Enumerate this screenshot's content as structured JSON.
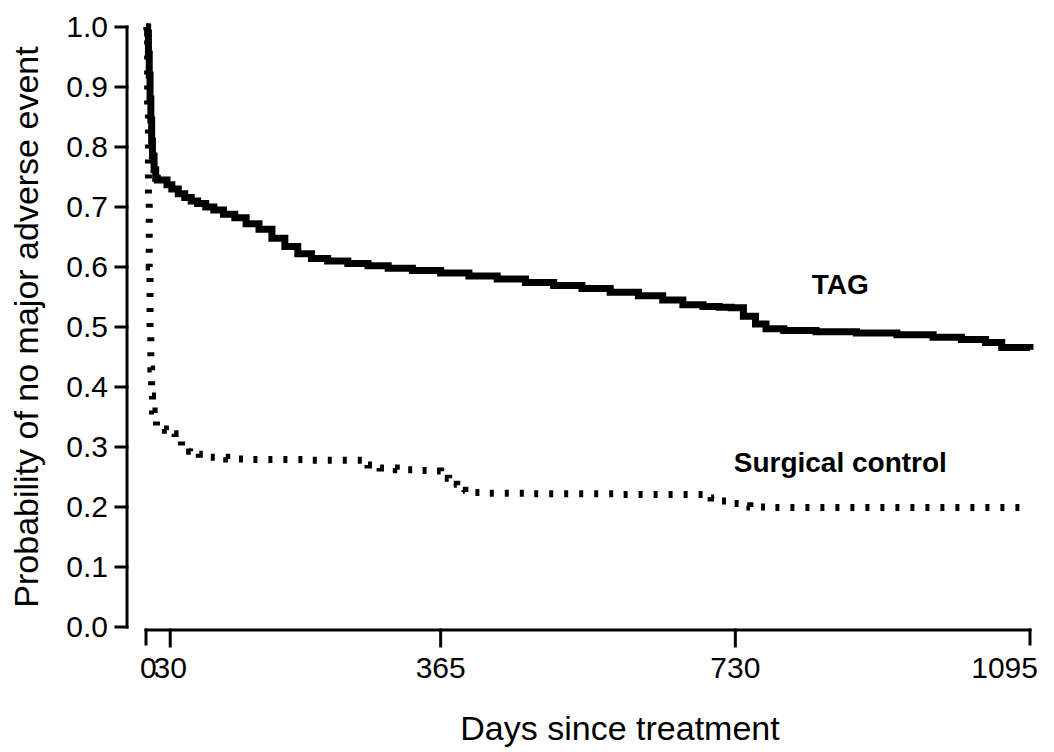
{
  "chart_data": {
    "type": "line",
    "title": "",
    "subtitle": "",
    "xlabel": "Days since treatment",
    "ylabel": "Probability of no major adverse event",
    "xlim": [
      0,
      1095
    ],
    "ylim": [
      0.0,
      1.0
    ],
    "grid": false,
    "legend_position": "inline-annotation",
    "x_ticks": [
      0,
      30,
      365,
      730,
      1095
    ],
    "x_tick_labels": [
      "0",
      "30",
      "365",
      "730",
      "1095"
    ],
    "y_ticks": [
      0.0,
      0.1,
      0.2,
      0.3,
      0.4,
      0.5,
      0.6,
      0.7,
      0.8,
      0.9,
      1.0
    ],
    "y_tick_labels": [
      "0.0",
      "0.1",
      "0.2",
      "0.3",
      "0.4",
      "0.5",
      "0.6",
      "0.7",
      "0.8",
      "0.9",
      "1.0"
    ],
    "annotations": [
      {
        "text": "TAG",
        "x": 860,
        "y": 0.555,
        "style": "bold"
      },
      {
        "text": "Surgical control",
        "x": 860,
        "y": 0.258,
        "style": "bold"
      }
    ],
    "series": [
      {
        "name": "TAG",
        "style": "solid",
        "points": [
          [
            0,
            1.0
          ],
          [
            2,
            0.99
          ],
          [
            3,
            0.955
          ],
          [
            4,
            0.92
          ],
          [
            5,
            0.88
          ],
          [
            6,
            0.845
          ],
          [
            7,
            0.81
          ],
          [
            8,
            0.785
          ],
          [
            10,
            0.762
          ],
          [
            12,
            0.748
          ],
          [
            14,
            0.745
          ],
          [
            22,
            0.745
          ],
          [
            26,
            0.737
          ],
          [
            32,
            0.73
          ],
          [
            40,
            0.722
          ],
          [
            48,
            0.716
          ],
          [
            56,
            0.71
          ],
          [
            64,
            0.706
          ],
          [
            74,
            0.7
          ],
          [
            84,
            0.695
          ],
          [
            96,
            0.688
          ],
          [
            110,
            0.682
          ],
          [
            124,
            0.672
          ],
          [
            140,
            0.663
          ],
          [
            156,
            0.648
          ],
          [
            172,
            0.634
          ],
          [
            188,
            0.622
          ],
          [
            205,
            0.614
          ],
          [
            225,
            0.61
          ],
          [
            250,
            0.606
          ],
          [
            275,
            0.602
          ],
          [
            300,
            0.598
          ],
          [
            330,
            0.594
          ],
          [
            365,
            0.59
          ],
          [
            400,
            0.585
          ],
          [
            435,
            0.58
          ],
          [
            470,
            0.574
          ],
          [
            505,
            0.569
          ],
          [
            540,
            0.564
          ],
          [
            575,
            0.558
          ],
          [
            610,
            0.552
          ],
          [
            640,
            0.545
          ],
          [
            665,
            0.537
          ],
          [
            690,
            0.534
          ],
          [
            710,
            0.533
          ],
          [
            725,
            0.532
          ],
          [
            740,
            0.518
          ],
          [
            755,
            0.505
          ],
          [
            768,
            0.497
          ],
          [
            790,
            0.494
          ],
          [
            830,
            0.492
          ],
          [
            880,
            0.49
          ],
          [
            930,
            0.487
          ],
          [
            975,
            0.483
          ],
          [
            1010,
            0.479
          ],
          [
            1040,
            0.474
          ],
          [
            1060,
            0.466
          ],
          [
            1095,
            0.462
          ]
        ]
      },
      {
        "name": "Surgical control",
        "style": "dotted",
        "points": [
          [
            0,
            1.0
          ],
          [
            1,
            0.98
          ],
          [
            2,
            0.86
          ],
          [
            3,
            0.72
          ],
          [
            4,
            0.6
          ],
          [
            5,
            0.5
          ],
          [
            6,
            0.43
          ],
          [
            7,
            0.385
          ],
          [
            8,
            0.36
          ],
          [
            10,
            0.345
          ],
          [
            13,
            0.335
          ],
          [
            17,
            0.33
          ],
          [
            24,
            0.328
          ],
          [
            30,
            0.322
          ],
          [
            36,
            0.31
          ],
          [
            44,
            0.3
          ],
          [
            54,
            0.293
          ],
          [
            66,
            0.288
          ],
          [
            80,
            0.283
          ],
          [
            100,
            0.28
          ],
          [
            130,
            0.279
          ],
          [
            165,
            0.279
          ],
          [
            200,
            0.278
          ],
          [
            235,
            0.278
          ],
          [
            268,
            0.277
          ],
          [
            275,
            0.27
          ],
          [
            290,
            0.265
          ],
          [
            310,
            0.262
          ],
          [
            335,
            0.261
          ],
          [
            355,
            0.26
          ],
          [
            365,
            0.248
          ],
          [
            375,
            0.238
          ],
          [
            385,
            0.228
          ],
          [
            395,
            0.224
          ],
          [
            420,
            0.223
          ],
          [
            470,
            0.222
          ],
          [
            530,
            0.222
          ],
          [
            590,
            0.221
          ],
          [
            650,
            0.221
          ],
          [
            690,
            0.221
          ],
          [
            700,
            0.215
          ],
          [
            712,
            0.21
          ],
          [
            722,
            0.206
          ],
          [
            735,
            0.202
          ],
          [
            748,
            0.2
          ],
          [
            770,
            0.199
          ],
          [
            820,
            0.199
          ],
          [
            880,
            0.199
          ],
          [
            940,
            0.199
          ],
          [
            1000,
            0.199
          ],
          [
            1050,
            0.199
          ],
          [
            1095,
            0.199
          ]
        ]
      }
    ]
  },
  "geometry": {
    "plot_left": 146,
    "plot_right": 1030,
    "y_top_px": 27,
    "y_bottom_px": 627,
    "axis_x_px": 127,
    "axis_y_px": 630
  }
}
